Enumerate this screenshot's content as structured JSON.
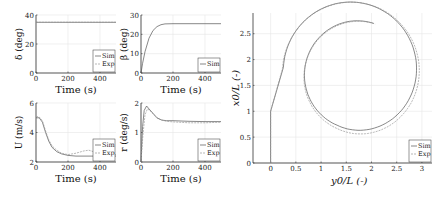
{
  "chart_data": [
    {
      "id": "delta",
      "type": "line",
      "ylabel": "δ (deg)",
      "xlabel": "Time (s)",
      "xlim": [
        0,
        500
      ],
      "ylim": [
        0,
        40
      ],
      "xticks": [
        0,
        200,
        400
      ],
      "yticks": [
        0,
        20,
        40
      ],
      "grid": true,
      "legend": [
        "Sim",
        "Exp"
      ],
      "legend_position": "lower right",
      "series": [
        {
          "name": "Sim",
          "x": [
            0,
            500
          ],
          "y": [
            35,
            35
          ]
        },
        {
          "name": "Exp",
          "x": [
            0,
            500
          ],
          "y": [
            35,
            35
          ]
        }
      ]
    },
    {
      "id": "beta",
      "type": "line",
      "ylabel": "β (deg)",
      "xlabel": "Time (s)",
      "xlim": [
        0,
        500
      ],
      "ylim": [
        0,
        30
      ],
      "xticks": [
        0,
        200,
        400
      ],
      "yticks": [
        0,
        10,
        20,
        30
      ],
      "grid": true,
      "legend": [
        "Sim"
      ],
      "legend_position": "lower right",
      "series": [
        {
          "name": "Sim",
          "x": [
            0,
            10,
            25,
            50,
            75,
            100,
            125,
            150,
            200,
            300,
            400,
            500
          ],
          "y": [
            0,
            5,
            11,
            18,
            22,
            24,
            25,
            25.4,
            25.5,
            25.5,
            25.5,
            25.5
          ]
        }
      ]
    },
    {
      "id": "U",
      "type": "line",
      "ylabel": "U (m/s)",
      "xlabel": "Time (s)",
      "xlim": [
        0,
        500
      ],
      "ylim": [
        2,
        6
      ],
      "xticks": [
        0,
        200,
        400
      ],
      "yticks": [
        2,
        4,
        6
      ],
      "grid": true,
      "legend": [
        "Sim",
        "Exp"
      ],
      "legend_position": "lower right",
      "series": [
        {
          "name": "Sim",
          "x": [
            0,
            20,
            40,
            60,
            80,
            100,
            130,
            160,
            200,
            250,
            300,
            350,
            400,
            450,
            500
          ],
          "y": [
            5.0,
            5.0,
            4.7,
            4.0,
            3.4,
            3.0,
            2.7,
            2.55,
            2.45,
            2.4,
            2.4,
            2.4,
            2.4,
            2.4,
            2.4
          ]
        },
        {
          "name": "Exp",
          "x": [
            0,
            20,
            40,
            60,
            80,
            100,
            130,
            160,
            200,
            250,
            300,
            330,
            360,
            400,
            450,
            500
          ],
          "y": [
            5.1,
            5.05,
            4.8,
            4.1,
            3.5,
            3.1,
            2.8,
            2.6,
            2.5,
            2.6,
            2.75,
            2.8,
            2.7,
            2.5,
            2.45,
            2.5
          ]
        }
      ]
    },
    {
      "id": "r",
      "type": "line",
      "ylabel": "r (deg/s)",
      "xlabel": "Time (s)",
      "xlim": [
        0,
        500
      ],
      "ylim": [
        0,
        2
      ],
      "xticks": [
        0,
        200,
        400
      ],
      "yticks": [
        0,
        1,
        2
      ],
      "grid": true,
      "legend": [
        "Sim",
        "Exp"
      ],
      "legend_position": "lower right",
      "series": [
        {
          "name": "Sim",
          "x": [
            0,
            10,
            20,
            35,
            50,
            75,
            100,
            130,
            160,
            200,
            300,
            400,
            500
          ],
          "y": [
            0,
            1.2,
            1.75,
            1.9,
            1.8,
            1.65,
            1.5,
            1.42,
            1.4,
            1.4,
            1.38,
            1.37,
            1.37
          ]
        },
        {
          "name": "Exp",
          "x": [
            0,
            12,
            25,
            40,
            55,
            80,
            100,
            130,
            160,
            200,
            300,
            400,
            500
          ],
          "y": [
            0,
            0.9,
            1.6,
            1.8,
            1.75,
            1.6,
            1.48,
            1.42,
            1.38,
            1.36,
            1.33,
            1.33,
            1.35
          ]
        }
      ]
    },
    {
      "id": "trajectory",
      "type": "line",
      "ylabel": "x0/L (-)",
      "xlabel": "y0/L (-)",
      "xlim": [
        -0.35,
        3.2
      ],
      "ylim": [
        0,
        2.9
      ],
      "xticks": [
        0,
        0.5,
        1,
        1.5,
        2,
        2.5,
        3
      ],
      "yticks": [
        0,
        0.5,
        1,
        1.5,
        2,
        2.5
      ],
      "grid": true,
      "legend": [
        "Sim",
        "Exp"
      ],
      "legend_position": "lower right",
      "series": [
        {
          "name": "Sim",
          "description": "turning circle: straight from origin to x0≈1, spiraling to loop centered ≈(1.72,1.7), radius ≈1.05",
          "center": [
            1.72,
            1.7
          ],
          "radius": 1.05
        },
        {
          "name": "Exp",
          "description": "turning circle slightly offset",
          "center": [
            1.74,
            1.66
          ],
          "radius": 1.08
        }
      ]
    }
  ]
}
